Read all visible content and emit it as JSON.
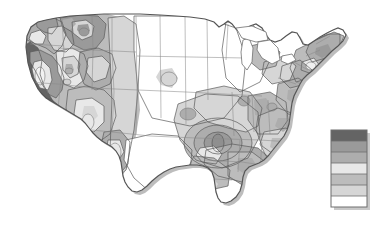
{
  "figure": {
    "title": "",
    "subtitle": "",
    "caption": "",
    "background_color": "#ffffff",
    "width": 376,
    "height": 240
  },
  "map": {
    "name": "contiguous-united-states",
    "projection_look": "albers-like",
    "outline_color": "#555555",
    "state_border_color": "#8a8a8a",
    "contour_line_color": "#5a5a5a",
    "shadow_color": "#bdbdbd",
    "base_fill": "#ffffff"
  },
  "legend": {
    "name": "grayscale-class-legend",
    "orientation": "vertical",
    "x": 331,
    "y": 130,
    "width": 36,
    "height": 77,
    "border_color": "#6e6e6e",
    "band_count": 7,
    "labels": [],
    "bands": [
      {
        "index": 1,
        "color": "#646464",
        "rank": "highest"
      },
      {
        "index": 2,
        "color": "#9a9a9a",
        "rank": "high"
      },
      {
        "index": 3,
        "color": "#adadad",
        "rank": "mid-high"
      },
      {
        "index": 4,
        "color": "#e8e8e8",
        "rank": "mid"
      },
      {
        "index": 5,
        "color": "#bcbcbc",
        "rank": "mid-low"
      },
      {
        "index": 6,
        "color": "#d6d6d6",
        "rank": "low"
      },
      {
        "index": 7,
        "color": "#ffffff",
        "rank": "lowest"
      }
    ]
  },
  "chart_data": {
    "type": "heatmap",
    "title": "",
    "xlabel": "",
    "ylabel": "",
    "legend_position": "right",
    "grid": false,
    "palette": [
      "#ffffff",
      "#d6d6d6",
      "#bcbcbc",
      "#e8e8e8",
      "#adadad",
      "#9a9a9a",
      "#646464"
    ],
    "class_count": 7,
    "regions": [
      {
        "name": "pacific-coast-california",
        "class": 7,
        "color": "#646464"
      },
      {
        "name": "sierra-nevada-interior-california",
        "class": 6,
        "color": "#9a9a9a"
      },
      {
        "name": "central-california-valley",
        "class": 4,
        "color": "#e8e8e8"
      },
      {
        "name": "pacific-northwest-coast",
        "class": 5,
        "color": "#adadad"
      },
      {
        "name": "cascades-oregon-washington",
        "class": 6,
        "color": "#9a9a9a"
      },
      {
        "name": "great-basin-nevada",
        "class": 3,
        "color": "#bcbcbc"
      },
      {
        "name": "idaho-montana-rockies",
        "class": 6,
        "color": "#9a9a9a"
      },
      {
        "name": "wyoming-colorado-rockies",
        "class": 5,
        "color": "#adadad"
      },
      {
        "name": "arizona-new-mexico",
        "class": 3,
        "color": "#bcbcbc"
      },
      {
        "name": "northern-great-plains",
        "class": 1,
        "color": "#ffffff"
      },
      {
        "name": "central-great-plains",
        "class": 1,
        "color": "#ffffff"
      },
      {
        "name": "texas",
        "class": 1,
        "color": "#ffffff"
      },
      {
        "name": "upper-midwest-minnesota-wisconsin",
        "class": 1,
        "color": "#ffffff"
      },
      {
        "name": "missouri-illinois-bullseye-core",
        "class": 6,
        "color": "#9a9a9a"
      },
      {
        "name": "missouri-illinois-bullseye-ring-2",
        "class": 5,
        "color": "#adadad"
      },
      {
        "name": "missouri-illinois-bullseye-ring-3",
        "class": 3,
        "color": "#bcbcbc"
      },
      {
        "name": "missouri-illinois-bullseye-ring-4",
        "class": 2,
        "color": "#d6d6d6"
      },
      {
        "name": "tennessee-kentucky",
        "class": 5,
        "color": "#adadad"
      },
      {
        "name": "southeast-appalachia",
        "class": 3,
        "color": "#bcbcbc"
      },
      {
        "name": "carolinas-virginia",
        "class": 2,
        "color": "#d6d6d6"
      },
      {
        "name": "mid-atlantic",
        "class": 3,
        "color": "#bcbcbc"
      },
      {
        "name": "new-england",
        "class": 3,
        "color": "#bcbcbc"
      },
      {
        "name": "northern-new-england",
        "class": 5,
        "color": "#adadad"
      },
      {
        "name": "gulf-coast-louisiana",
        "class": 2,
        "color": "#d6d6d6"
      },
      {
        "name": "florida",
        "class": 1,
        "color": "#ffffff"
      }
    ],
    "annotations": [
      {
        "name": "concentric-rings-center",
        "x": 218,
        "y": 143,
        "rings": 4
      }
    ]
  }
}
